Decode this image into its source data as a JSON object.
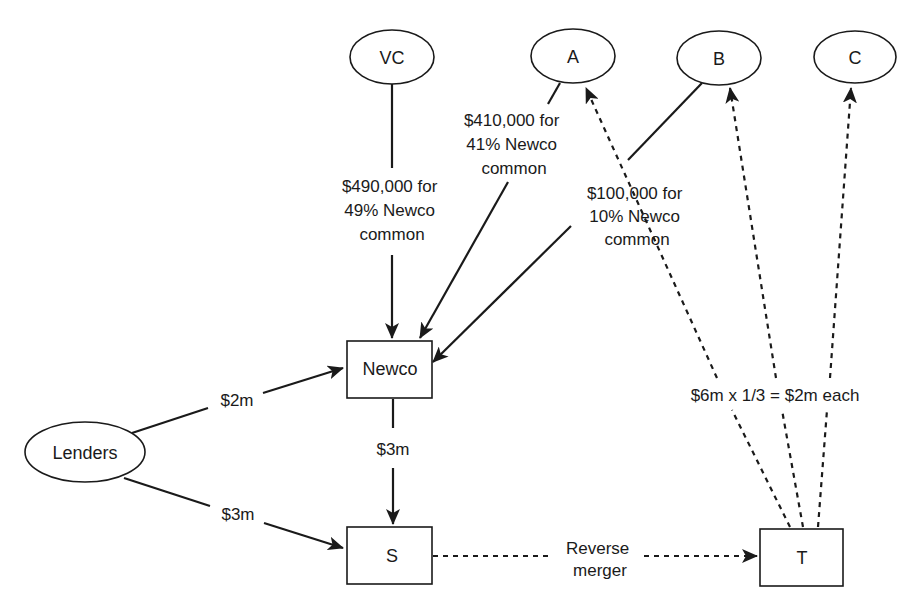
{
  "diagram": {
    "type": "flow-diagram",
    "nodes": {
      "vc": {
        "label": "VC",
        "shape": "ellipse"
      },
      "a": {
        "label": "A",
        "shape": "ellipse"
      },
      "b": {
        "label": "B",
        "shape": "ellipse"
      },
      "c": {
        "label": "C",
        "shape": "ellipse"
      },
      "newco": {
        "label": "Newco",
        "shape": "box"
      },
      "lenders": {
        "label": "Lenders",
        "shape": "ellipse"
      },
      "s": {
        "label": "S",
        "shape": "box"
      },
      "t": {
        "label": "T",
        "shape": "box"
      }
    },
    "edges": {
      "vc_newco": {
        "from": "VC",
        "to": "Newco",
        "style": "solid",
        "label_lines": [
          "$490,000 for",
          "49% Newco",
          "common"
        ]
      },
      "a_newco": {
        "from": "A",
        "to": "Newco",
        "style": "solid",
        "label_lines": [
          "$410,000 for",
          "41% Newco",
          "common"
        ]
      },
      "b_newco": {
        "from": "B",
        "to": "Newco",
        "style": "solid",
        "label_lines": [
          "$100,000 for",
          "10% Newco",
          "common"
        ]
      },
      "lenders_newco": {
        "from": "Lenders",
        "to": "Newco",
        "style": "solid",
        "label": "$2m"
      },
      "lenders_s": {
        "from": "Lenders",
        "to": "S",
        "style": "solid",
        "label": "$3m"
      },
      "newco_s": {
        "from": "Newco",
        "to": "S",
        "style": "solid",
        "label": "$3m"
      },
      "s_t": {
        "from": "S",
        "to": "T",
        "style": "dashed",
        "label_lines": [
          "Reverse",
          "merger"
        ]
      },
      "t_abc": {
        "from": "T",
        "to": [
          "A",
          "B",
          "C"
        ],
        "style": "dashed",
        "label": "$6m x 1/3 = $2m each"
      }
    }
  }
}
